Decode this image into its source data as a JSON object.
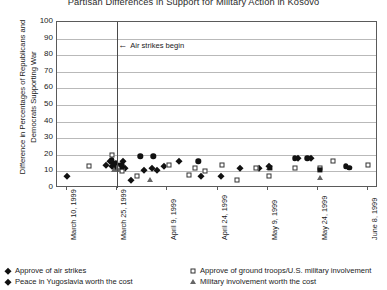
{
  "chart_data": {
    "type": "scatter",
    "title": "Partisan Differences in Support for Military Action in Kosovo",
    "xlabel": "",
    "ylabel": "Difference in Percentages of Republicans and Democrats Supporting War",
    "ylim": [
      0,
      100
    ],
    "yticks": [
      0,
      10,
      20,
      30,
      40,
      50,
      60,
      70,
      80,
      90,
      100
    ],
    "grid": true,
    "legend_position": "bottom",
    "xticks": [
      "March 10, 1999",
      "March 25, 1999",
      "April 9, 1999",
      "April 24, 1999",
      "May 9, 1999",
      "May 24, 1999",
      "June 8, 1999"
    ],
    "annotations": [
      {
        "text": "Air strikes begin",
        "arrow": "←",
        "x": "March 25, 1999",
        "y": 85
      }
    ],
    "series": [
      {
        "name": "Approve of air strikes",
        "marker": "diamond",
        "points": [
          {
            "x": 3.0,
            "y": 7
          },
          {
            "x": 15.2,
            "y": 14
          },
          {
            "x": 16.4,
            "y": 16
          },
          {
            "x": 17.2,
            "y": 13
          },
          {
            "x": 17.6,
            "y": 15
          },
          {
            "x": 18.0,
            "y": 12
          },
          {
            "x": 18.6,
            "y": 14
          },
          {
            "x": 19.4,
            "y": 13
          },
          {
            "x": 20.6,
            "y": 16
          },
          {
            "x": 21.2,
            "y": 12
          },
          {
            "x": 23.0,
            "y": 5
          },
          {
            "x": 27.0,
            "y": 11
          },
          {
            "x": 29.6,
            "y": 12
          },
          {
            "x": 31.0,
            "y": 11
          },
          {
            "x": 33.2,
            "y": 13
          },
          {
            "x": 38.0,
            "y": 16
          },
          {
            "x": 45.0,
            "y": 7
          },
          {
            "x": 51.0,
            "y": 7
          },
          {
            "x": 57.0,
            "y": 12
          },
          {
            "x": 63.0,
            "y": 12
          },
          {
            "x": 66.0,
            "y": 13
          },
          {
            "x": 75.0,
            "y": 18
          },
          {
            "x": 79.0,
            "y": 18
          }
        ]
      },
      {
        "name": "Approve of ground troops/U.S. military involvement",
        "marker": "square-open",
        "points": [
          {
            "x": 10.0,
            "y": 13
          },
          {
            "x": 17.0,
            "y": 20
          },
          {
            "x": 19.4,
            "y": 12
          },
          {
            "x": 20.4,
            "y": 10
          },
          {
            "x": 25.0,
            "y": 7
          },
          {
            "x": 35.0,
            "y": 14
          },
          {
            "x": 41.0,
            "y": 8
          },
          {
            "x": 43.0,
            "y": 12
          },
          {
            "x": 46.0,
            "y": 10
          },
          {
            "x": 51.5,
            "y": 14
          },
          {
            "x": 56.0,
            "y": 5
          },
          {
            "x": 62.0,
            "y": 12
          },
          {
            "x": 66.0,
            "y": 7
          },
          {
            "x": 74.0,
            "y": 12
          },
          {
            "x": 82.0,
            "y": 12
          },
          {
            "x": 86.0,
            "y": 16
          },
          {
            "x": 97.0,
            "y": 14
          }
        ]
      },
      {
        "name": "Peace in Yugoslavia worth the cost",
        "marker": "circle",
        "points": [
          {
            "x": 17.0,
            "y": 17
          },
          {
            "x": 18.4,
            "y": 15
          },
          {
            "x": 20.0,
            "y": 14
          },
          {
            "x": 26.0,
            "y": 19
          },
          {
            "x": 30.0,
            "y": 19
          },
          {
            "x": 44.0,
            "y": 16
          },
          {
            "x": 74.0,
            "y": 18
          },
          {
            "x": 78.0,
            "y": 18
          },
          {
            "x": 90.0,
            "y": 13
          },
          {
            "x": 91.0,
            "y": 12
          }
        ]
      },
      {
        "name": "Military involvement worth the cost",
        "marker": "triangle-open",
        "points": [
          {
            "x": 17.8,
            "y": 11
          },
          {
            "x": 19.0,
            "y": 11
          },
          {
            "x": 29.0,
            "y": 5
          },
          {
            "x": 66.0,
            "y": 12
          },
          {
            "x": 82.0,
            "y": 6
          }
        ]
      },
      {
        "name": "Military involvement worth the cost (filled)",
        "marker": "square-filled",
        "points": [
          {
            "x": 20.2,
            "y": 13
          },
          {
            "x": 66.2,
            "y": 12
          },
          {
            "x": 82.0,
            "y": 11
          }
        ]
      }
    ]
  },
  "legend": {
    "items": [
      {
        "marker": "diamond",
        "label": "Approve of air strikes"
      },
      {
        "marker": "square-open",
        "label": "Approve of ground troops/U.S. military involvement"
      },
      {
        "marker": "diamond",
        "label": "Peace in Yugoslavia worth the cost"
      },
      {
        "marker": "triangle-open",
        "label": "Military involvement worth the cost"
      }
    ]
  }
}
